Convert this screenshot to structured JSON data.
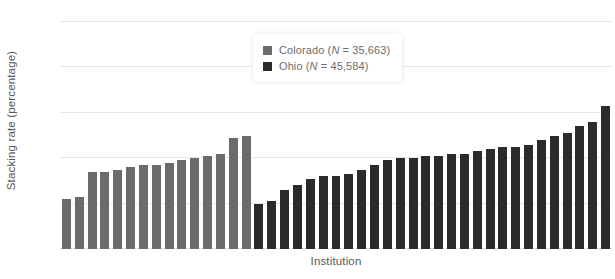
{
  "figure": {
    "cropped_title_remnant": "",
    "ylabel": "Stacking rate (percentage)",
    "xlabel": "Institution"
  },
  "legend": {
    "items": [
      {
        "label_name": "Colorado",
        "label_stat": "(N = 35,663)",
        "color": "#6b6b6b",
        "swatch_name": "colorado-swatch"
      },
      {
        "label_name": "Ohio",
        "label_stat": "(N = 45,584)",
        "color": "#2b2b2b",
        "swatch_name": "ohio-swatch"
      }
    ]
  },
  "yaxis": {
    "ticks": [
      "0",
      "20",
      "40",
      "60",
      "80",
      "100"
    ],
    "tick_values": [
      0,
      20,
      40,
      60,
      80,
      100
    ]
  },
  "chart_data": {
    "type": "bar",
    "title": "",
    "xlabel": "Institution",
    "ylabel": "Stacking rate (percentage)",
    "ylim": [
      0,
      100
    ],
    "yticks": [
      0,
      20,
      40,
      60,
      80,
      100
    ],
    "grid": "horizontal",
    "legend_position": "top-center",
    "xticklabels": [],
    "series": [
      {
        "name": "Colorado",
        "legend_label": "Colorado (N = 35,663)",
        "n": 35663,
        "color": "#6b6b6b",
        "values": [
          22,
          23,
          34,
          34,
          35,
          36,
          37,
          37,
          38,
          39,
          40,
          41,
          42,
          49,
          50
        ]
      },
      {
        "name": "Ohio",
        "legend_label": "Ohio (N = 45,584)",
        "n": 45584,
        "color": "#2b2b2b",
        "values": [
          20,
          21,
          26,
          28,
          31,
          32,
          32,
          33,
          35,
          37,
          39,
          40,
          40,
          41,
          41,
          42,
          42,
          43,
          44,
          45,
          45,
          46,
          48,
          50,
          51,
          54,
          56,
          63
        ]
      }
    ]
  }
}
